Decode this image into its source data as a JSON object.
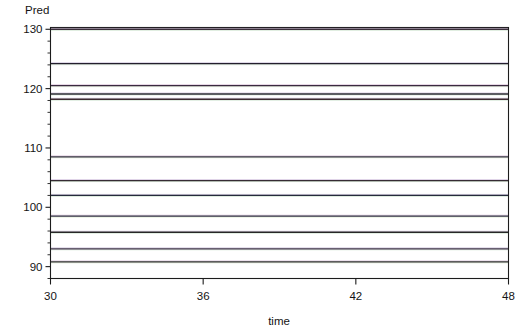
{
  "chart_data": {
    "type": "line",
    "title": "",
    "ylabel": "Pred",
    "xlabel": "time",
    "xlim": [
      30,
      48
    ],
    "ylim": [
      88.0,
      130.3
    ],
    "grid": false,
    "legend": "none",
    "x_ticks": [
      30,
      36,
      42,
      48
    ],
    "x_tick_labels": [
      "30",
      "36",
      "42",
      "48"
    ],
    "y_ticks": [
      90,
      100,
      110,
      120,
      130
    ],
    "y_tick_labels": [
      "90",
      "100",
      "110",
      "120",
      "130"
    ],
    "y_minor_step": 2,
    "x": [
      30,
      48
    ],
    "note": "Flat (constant) predicted series; each line is horizontal across the full time range 30-48",
    "series": [
      {
        "name": "series-1",
        "value": 130.0,
        "values": [
          130.0,
          130.0
        ],
        "color": "#3c2f3c"
      },
      {
        "name": "series-2",
        "value": 124.2,
        "values": [
          124.2,
          124.2
        ],
        "color": "#241f2e"
      },
      {
        "name": "series-3",
        "value": 120.5,
        "values": [
          120.5,
          120.5
        ],
        "color": "#3a2a40"
      },
      {
        "name": "series-4",
        "value": 119.1,
        "values": [
          119.1,
          119.1
        ],
        "color": "#2b2b33"
      },
      {
        "name": "series-5",
        "value": 118.2,
        "values": [
          118.2,
          118.2
        ],
        "color": "#3d2b30"
      },
      {
        "name": "series-6",
        "value": 108.5,
        "values": [
          108.5,
          108.5
        ],
        "color": "#2e2c3a"
      },
      {
        "name": "series-7",
        "value": 104.5,
        "values": [
          104.5,
          104.5
        ],
        "color": "#352b33"
      },
      {
        "name": "series-8",
        "value": 102.0,
        "values": [
          102.0,
          102.0
        ],
        "color": "#262b3c"
      },
      {
        "name": "series-9",
        "value": 98.5,
        "values": [
          98.5,
          98.5
        ],
        "color": "#2d2d3e"
      },
      {
        "name": "series-10",
        "value": 95.8,
        "values": [
          95.8,
          95.8
        ],
        "color": "#272727"
      },
      {
        "name": "series-11",
        "value": 93.0,
        "values": [
          93.0,
          93.0
        ],
        "color": "#3a2f44"
      },
      {
        "name": "series-12",
        "value": 90.8,
        "values": [
          90.8,
          90.8
        ],
        "color": "#2b2b2b"
      }
    ]
  },
  "frame": {
    "border_color": "#1c1c1c",
    "background": "#ffffff"
  }
}
